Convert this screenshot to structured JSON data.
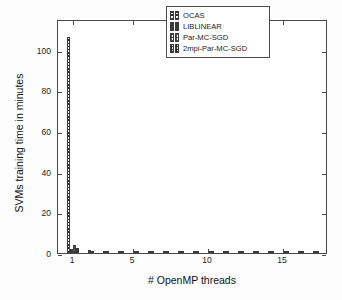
{
  "chart_data": {
    "type": "bar",
    "title": "",
    "xlabel": "# OpenMP threads",
    "ylabel": "SVMs training time in minutes",
    "xlim": [
      0,
      18
    ],
    "ylim": [
      0,
      115
    ],
    "xticks": [
      1,
      5,
      10,
      15
    ],
    "yticks": [
      0,
      20,
      40,
      60,
      80,
      100
    ],
    "grid": false,
    "legend_position": "top-right",
    "categories": [
      1,
      2,
      3,
      4,
      5,
      6,
      7,
      8,
      9,
      10,
      11,
      12,
      13,
      14,
      15,
      16,
      17
    ],
    "series": [
      {
        "name": "OCAS",
        "pattern": "horizontal-lines",
        "values": [
          106,
          0,
          0,
          0,
          0,
          0,
          0,
          0,
          0,
          0,
          0,
          0,
          0,
          0,
          0,
          0,
          0
        ]
      },
      {
        "name": "LIBLINEAR",
        "pattern": "solid",
        "values": [
          2.2,
          0,
          0,
          0,
          0,
          0,
          0,
          0,
          0,
          0,
          0,
          0,
          0,
          0,
          0,
          0,
          0
        ]
      },
      {
        "name": "Par-MC-SGD",
        "pattern": "checker-light",
        "values": [
          4.1,
          1.6,
          1.1,
          0.9,
          0.8,
          0.75,
          0.7,
          0.65,
          0.6,
          0.6,
          0.55,
          0.55,
          0.5,
          0.5,
          0.5,
          0.45,
          0.45
        ]
      },
      {
        "name": "2mpi-Par-MC-SGD",
        "pattern": "checker-dark",
        "values": [
          2.3,
          1.2,
          0.9,
          0.8,
          0.7,
          0.65,
          0.6,
          0.55,
          0.55,
          0.5,
          0.5,
          0.45,
          0.45,
          0.4,
          0.4,
          0.4,
          0.4
        ]
      }
    ],
    "annotations": []
  },
  "axes": {
    "y_title": "SVMs training time in minutes",
    "x_title": "# OpenMP threads",
    "y_tick_labels": [
      "0",
      "20",
      "40",
      "60",
      "80",
      "100"
    ],
    "x_tick_labels": [
      "1",
      "5",
      "10",
      "15"
    ]
  },
  "legend": {
    "entries": [
      {
        "label": "OCAS"
      },
      {
        "label": "LIBLINEAR"
      },
      {
        "label": "Par-MC-SGD"
      },
      {
        "label": "2mpi-Par-MC-SGD"
      }
    ]
  },
  "colors": {
    "axis": "#4a4a4a",
    "text": "#1a1a1a",
    "background": "#ffffff",
    "bar_edge": "#3b3b3b",
    "hatch": "#2b2b2b"
  }
}
